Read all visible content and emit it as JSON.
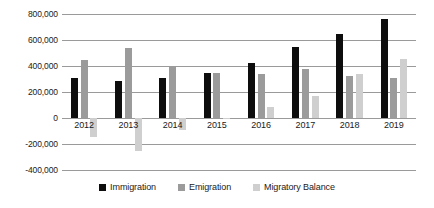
{
  "chart_data": {
    "type": "bar",
    "title": "",
    "subtitle": "",
    "xlabel": "",
    "ylabel": "",
    "categories": [
      "2012",
      "2013",
      "2014",
      "2015",
      "2016",
      "2017",
      "2018",
      "2019"
    ],
    "series": [
      {
        "name": "Immigration",
        "color": "#0d0d0d",
        "values": [
          305000,
          285000,
          310000,
          348000,
          420000,
          545000,
          650000,
          760000
        ]
      },
      {
        "name": "Emigration",
        "color": "#9b9b9b",
        "values": [
          450000,
          535000,
          400000,
          347000,
          335000,
          378000,
          320000,
          305000
        ]
      },
      {
        "name": "Migratory Balance",
        "color": "#cfcfcf",
        "values": [
          -145000,
          -250000,
          -90000,
          1000,
          88000,
          168000,
          338000,
          455000
        ]
      }
    ],
    "ylim": [
      -400000,
      800000
    ],
    "yticks": [
      800000,
      600000,
      400000,
      200000,
      0,
      -200000,
      -400000
    ],
    "ytick_labels": [
      "800,000",
      "600,000",
      "400,000",
      "200,000",
      "0",
      "-200,000",
      "-400,000"
    ],
    "grid": true,
    "legend_position": "bottom"
  }
}
